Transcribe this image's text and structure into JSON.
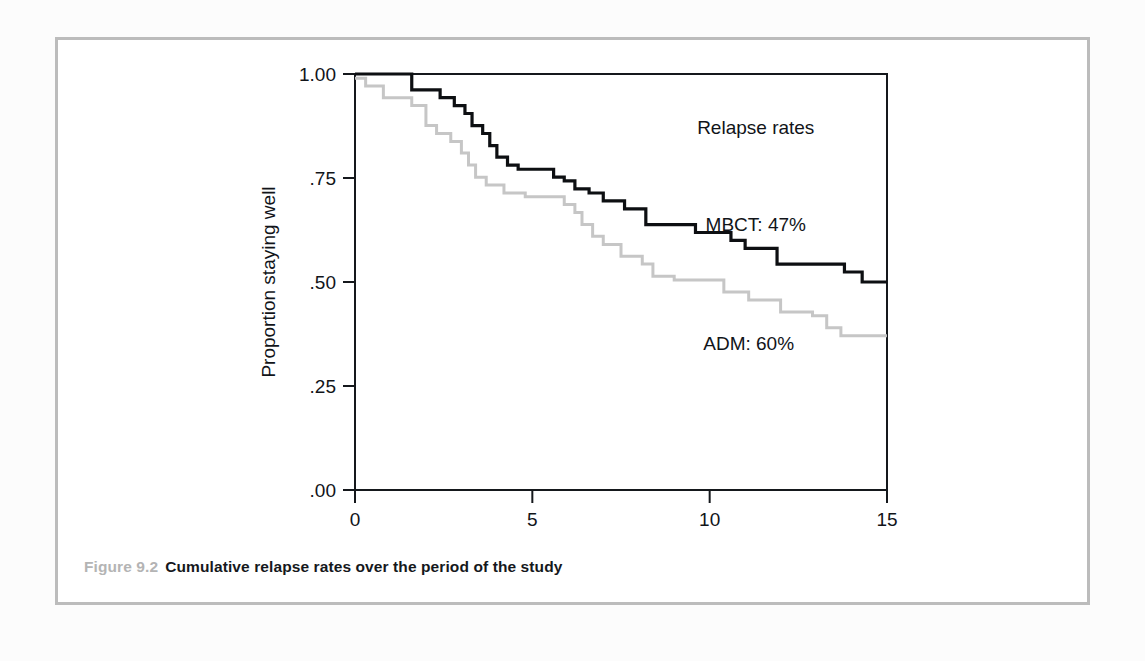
{
  "figure": {
    "caption_number": "Figure 9.2",
    "caption_text": "Cumulative relapse rates over the period of the study",
    "number_color": "#b4b4b4",
    "text_color": "#15181c",
    "frame_color": "#bcbcbc"
  },
  "chart_data": {
    "type": "line",
    "subtype": "kaplan-meier-step",
    "title": "",
    "xlabel": "Analysis time (in months)",
    "ylabel": "Proportion staying well",
    "xlim": [
      0,
      15
    ],
    "ylim": [
      0,
      1
    ],
    "xticks": [
      0,
      5,
      10,
      15
    ],
    "xtick_labels": [
      "0",
      "5",
      "10",
      "15"
    ],
    "yticks": [
      0,
      0.25,
      0.5,
      0.75,
      1.0
    ],
    "ytick_labels": [
      ".00",
      ".25",
      ".50",
      ".75",
      "1.00"
    ],
    "grid": false,
    "legend_position": "inside-right",
    "annotations": [
      {
        "name": "legend-title",
        "text": "Relapse rates",
        "x": 11.3,
        "y": 0.855
      },
      {
        "name": "mbct-label",
        "text": "MBCT: 47%",
        "x": 11.3,
        "y": 0.622
      },
      {
        "name": "adm-label",
        "text": "ADM: 60%",
        "x": 11.1,
        "y": 0.337
      }
    ],
    "series": [
      {
        "name": "MBCT",
        "label": "MBCT: 47%",
        "relapse_rate_percent": 47,
        "color": "#0d0f12",
        "line_width": 3.2,
        "points": [
          [
            0.0,
            1.0
          ],
          [
            1.6,
            1.0
          ],
          [
            1.6,
            0.962
          ],
          [
            2.4,
            0.962
          ],
          [
            2.4,
            0.943
          ],
          [
            2.8,
            0.943
          ],
          [
            2.8,
            0.924
          ],
          [
            3.1,
            0.924
          ],
          [
            3.1,
            0.905
          ],
          [
            3.3,
            0.905
          ],
          [
            3.3,
            0.876
          ],
          [
            3.6,
            0.876
          ],
          [
            3.6,
            0.857
          ],
          [
            3.8,
            0.857
          ],
          [
            3.8,
            0.828
          ],
          [
            4.0,
            0.828
          ],
          [
            4.0,
            0.8
          ],
          [
            4.3,
            0.8
          ],
          [
            4.3,
            0.781
          ],
          [
            4.6,
            0.781
          ],
          [
            4.6,
            0.771
          ],
          [
            5.6,
            0.771
          ],
          [
            5.6,
            0.752
          ],
          [
            5.9,
            0.752
          ],
          [
            5.9,
            0.743
          ],
          [
            6.2,
            0.743
          ],
          [
            6.2,
            0.724
          ],
          [
            6.6,
            0.724
          ],
          [
            6.6,
            0.714
          ],
          [
            7.0,
            0.714
          ],
          [
            7.0,
            0.695
          ],
          [
            7.6,
            0.695
          ],
          [
            7.6,
            0.676
          ],
          [
            8.2,
            0.676
          ],
          [
            8.2,
            0.638
          ],
          [
            9.6,
            0.638
          ],
          [
            9.6,
            0.619
          ],
          [
            10.6,
            0.619
          ],
          [
            10.6,
            0.6
          ],
          [
            11.0,
            0.6
          ],
          [
            11.0,
            0.581
          ],
          [
            11.9,
            0.581
          ],
          [
            11.9,
            0.543
          ],
          [
            13.8,
            0.543
          ],
          [
            13.8,
            0.524
          ],
          [
            14.3,
            0.524
          ],
          [
            14.3,
            0.5
          ],
          [
            15.0,
            0.5
          ]
        ]
      },
      {
        "name": "ADM",
        "label": "ADM: 60%",
        "relapse_rate_percent": 60,
        "color": "#c6c6c6",
        "line_width": 3.0,
        "points": [
          [
            0.0,
            0.99
          ],
          [
            0.3,
            0.99
          ],
          [
            0.3,
            0.971
          ],
          [
            0.8,
            0.971
          ],
          [
            0.8,
            0.943
          ],
          [
            1.6,
            0.943
          ],
          [
            1.6,
            0.924
          ],
          [
            2.0,
            0.924
          ],
          [
            2.0,
            0.876
          ],
          [
            2.3,
            0.876
          ],
          [
            2.3,
            0.857
          ],
          [
            2.7,
            0.857
          ],
          [
            2.7,
            0.838
          ],
          [
            3.0,
            0.838
          ],
          [
            3.0,
            0.81
          ],
          [
            3.2,
            0.81
          ],
          [
            3.2,
            0.781
          ],
          [
            3.4,
            0.781
          ],
          [
            3.4,
            0.752
          ],
          [
            3.7,
            0.752
          ],
          [
            3.7,
            0.733
          ],
          [
            4.2,
            0.733
          ],
          [
            4.2,
            0.714
          ],
          [
            4.8,
            0.714
          ],
          [
            4.8,
            0.705
          ],
          [
            5.9,
            0.705
          ],
          [
            5.9,
            0.686
          ],
          [
            6.2,
            0.686
          ],
          [
            6.2,
            0.667
          ],
          [
            6.4,
            0.667
          ],
          [
            6.4,
            0.638
          ],
          [
            6.7,
            0.638
          ],
          [
            6.7,
            0.61
          ],
          [
            7.0,
            0.61
          ],
          [
            7.0,
            0.59
          ],
          [
            7.5,
            0.59
          ],
          [
            7.5,
            0.562
          ],
          [
            8.1,
            0.562
          ],
          [
            8.1,
            0.543
          ],
          [
            8.4,
            0.543
          ],
          [
            8.4,
            0.514
          ],
          [
            9.0,
            0.514
          ],
          [
            9.0,
            0.505
          ],
          [
            10.4,
            0.505
          ],
          [
            10.4,
            0.476
          ],
          [
            11.1,
            0.476
          ],
          [
            11.1,
            0.457
          ],
          [
            12.0,
            0.457
          ],
          [
            12.0,
            0.428
          ],
          [
            12.9,
            0.428
          ],
          [
            12.9,
            0.419
          ],
          [
            13.3,
            0.419
          ],
          [
            13.3,
            0.39
          ],
          [
            13.7,
            0.39
          ],
          [
            13.7,
            0.371
          ],
          [
            15.0,
            0.371
          ]
        ]
      }
    ]
  }
}
